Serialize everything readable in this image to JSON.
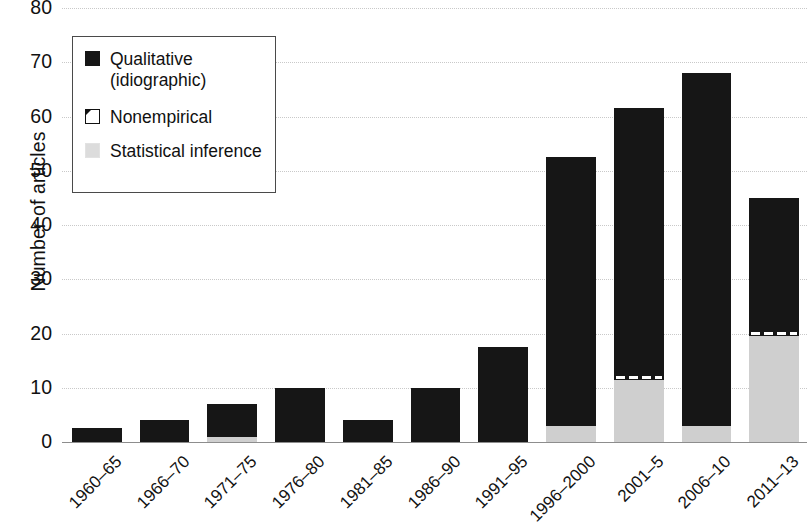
{
  "chart_data": {
    "type": "bar",
    "stacked": true,
    "title": "",
    "xlabel": "",
    "ylabel": "Number of articles",
    "ylim": [
      0,
      80
    ],
    "yticks": [
      0,
      10,
      20,
      30,
      40,
      50,
      60,
      70,
      80
    ],
    "grid": true,
    "legend_position": "top-left",
    "categories": [
      "1960–65",
      "1966–70",
      "1971–75",
      "1976–80",
      "1981–85",
      "1986–90",
      "1991–95",
      "1996–2000",
      "2001–5",
      "2006–10",
      "2011–13"
    ],
    "series": [
      {
        "name": "Statistical inference",
        "color": "#cfcfcf",
        "values": [
          0,
          0,
          1,
          0,
          0,
          0,
          0,
          3,
          11.5,
          3,
          19.5
        ]
      },
      {
        "name": "Nonempirical",
        "color": "#ffffff",
        "values": [
          0,
          0,
          0,
          0,
          0,
          0,
          0,
          0,
          1,
          0,
          1
        ]
      },
      {
        "name": "Qualitative (idiographic)",
        "color": "#161616",
        "values": [
          2.5,
          4,
          6,
          10,
          4,
          10,
          17.5,
          49.5,
          49,
          65,
          24.5
        ]
      }
    ],
    "totals": [
      2.5,
      4,
      7,
      10,
      4,
      10,
      17.5,
      52.5,
      61.5,
      68,
      45
    ]
  },
  "legend": {
    "items": [
      {
        "label": "Qualitative\n(idiographic)",
        "swatch": "black-square-icon"
      },
      {
        "label": "Nonempirical",
        "swatch": "white-square-icon"
      },
      {
        "label": "Statistical inference",
        "swatch": "gray-square-icon"
      }
    ]
  },
  "axis": {
    "y_title": "Number of articles"
  }
}
